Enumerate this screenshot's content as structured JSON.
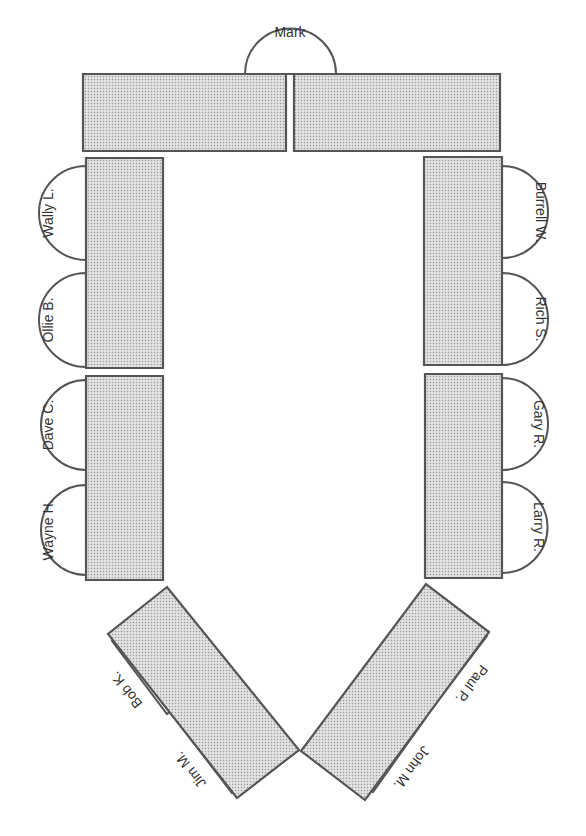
{
  "diagram": {
    "colors": {
      "background": "#ffffff",
      "table_stroke": "#555555",
      "table_fill_base": "#e2e2e2",
      "table_dot": "#9a9a9a",
      "seat_stroke": "#555555",
      "seat_fill": "#ffffff",
      "label": "#333333"
    },
    "tables": [
      {
        "id": "top-left",
        "points": [
          [
            83,
            74
          ],
          [
            286,
            74
          ],
          [
            286,
            151
          ],
          [
            83,
            151
          ]
        ]
      },
      {
        "id": "top-right",
        "points": [
          [
            294,
            74
          ],
          [
            500,
            74
          ],
          [
            500,
            151
          ],
          [
            294,
            151
          ]
        ]
      },
      {
        "id": "left-upper",
        "points": [
          [
            86,
            158
          ],
          [
            163,
            158
          ],
          [
            163,
            368
          ],
          [
            86,
            368
          ]
        ]
      },
      {
        "id": "left-lower",
        "points": [
          [
            86,
            376
          ],
          [
            163,
            376
          ],
          [
            163,
            580
          ],
          [
            86,
            580
          ]
        ]
      },
      {
        "id": "right-upper",
        "points": [
          [
            424,
            157
          ],
          [
            502,
            157
          ],
          [
            502,
            365
          ],
          [
            424,
            365
          ]
        ]
      },
      {
        "id": "right-lower",
        "points": [
          [
            425,
            374
          ],
          [
            502,
            374
          ],
          [
            502,
            578
          ],
          [
            425,
            578
          ]
        ]
      },
      {
        "id": "slant-left",
        "points": [
          [
            167,
            587
          ],
          [
            108,
            634
          ],
          [
            237,
            798
          ],
          [
            299,
            750
          ]
        ]
      },
      {
        "id": "slant-right",
        "points": [
          [
            426,
            584
          ],
          [
            489,
            632
          ],
          [
            365,
            800
          ],
          [
            301,
            751
          ]
        ]
      }
    ],
    "seats": [
      {
        "name": "Mark",
        "a": [
          336,
          74
        ],
        "b": [
          245,
          74
        ],
        "label_pos": [
          290,
          32
        ],
        "rotate": 0
      },
      {
        "name": "Wally L.",
        "a": [
          86,
          166
        ],
        "b": [
          86,
          260
        ],
        "label_pos": [
          48,
          213
        ],
        "rotate": -90
      },
      {
        "name": "Ollie B.",
        "a": [
          86,
          273
        ],
        "b": [
          86,
          367
        ],
        "label_pos": [
          48,
          320
        ],
        "rotate": -90
      },
      {
        "name": "Dave C.",
        "a": [
          86,
          380
        ],
        "b": [
          86,
          470
        ],
        "label_pos": [
          48,
          425
        ],
        "rotate": -90
      },
      {
        "name": "Wayne H.",
        "a": [
          86,
          485
        ],
        "b": [
          86,
          575
        ],
        "label_pos": [
          48,
          530
        ],
        "rotate": -90
      },
      {
        "name": "Burrell W.",
        "a": [
          502,
          258
        ],
        "b": [
          502,
          166
        ],
        "label_pos": [
          541,
          212
        ],
        "rotate": 90
      },
      {
        "name": "Rich S.",
        "a": [
          502,
          365
        ],
        "b": [
          502,
          273
        ],
        "label_pos": [
          541,
          319
        ],
        "rotate": 90
      },
      {
        "name": "Gary R.",
        "a": [
          502,
          470
        ],
        "b": [
          502,
          378
        ],
        "label_pos": [
          539,
          424
        ],
        "rotate": 90
      },
      {
        "name": "Larry R.",
        "a": [
          502,
          573
        ],
        "b": [
          502,
          482
        ],
        "label_pos": [
          539,
          527
        ],
        "rotate": 90
      },
      {
        "name": "Bob K.",
        "a": [
          167,
          714
        ],
        "b": [
          112,
          641
        ],
        "label_pos": [
          126,
          690
        ],
        "rotate": -128
      },
      {
        "name": "Jim M.",
        "a": [
          232,
          793
        ],
        "b": [
          176,
          720
        ],
        "label_pos": [
          190,
          770
        ],
        "rotate": -128
      },
      {
        "name": "Paul P.",
        "a": [
          487,
          636
        ],
        "b": [
          433,
          707
        ],
        "label_pos": [
          472,
          684
        ],
        "rotate": 127
      },
      {
        "name": "John M.",
        "a": [
          425,
          719
        ],
        "b": [
          373,
          792
        ],
        "label_pos": [
          412,
          768
        ],
        "rotate": 127
      }
    ]
  }
}
